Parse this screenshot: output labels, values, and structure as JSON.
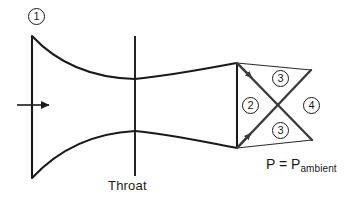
{
  "diagram": {
    "type": "schematic",
    "background_color": "#ffffff",
    "line_color": "#1a1a1a",
    "shock_line_color": "#3c3c3c",
    "labels": {
      "throat": "Throat",
      "ambient_pressure_main": "P = P",
      "ambient_pressure_subscript": "ambient"
    },
    "region_numbers": {
      "inlet": "1",
      "exit_core": "2",
      "oblique_shock_upper": "3",
      "oblique_shock_lower": "3",
      "downstream": "4"
    },
    "flow_arrow": {
      "name": "inlet-flow-arrow",
      "direction": "right",
      "x_start": 17,
      "x_end": 50,
      "y": 105
    },
    "geometry": {
      "inlet_plane_x": 32,
      "inlet_top_y": 36,
      "inlet_bottom_y": 178,
      "throat_x": 135,
      "throat_top_y": 79,
      "throat_bottom_y": 131,
      "throat_line_top_y": 36,
      "throat_line_bottom_y": 176,
      "exit_plane_x": 237,
      "exit_top_y": 63,
      "exit_bottom_y": 148,
      "plume_tip_upper_x": 311,
      "plume_tip_upper_y": 70,
      "plume_tip_lower_x": 312,
      "plume_tip_lower_y": 140
    }
  }
}
